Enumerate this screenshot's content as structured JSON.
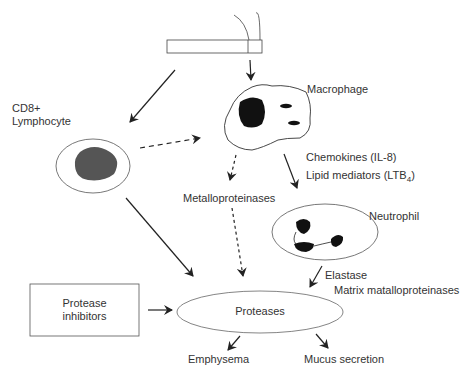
{
  "diagram": {
    "labels": {
      "macrophage": "Macrophage",
      "cd8_line1": "CD8+",
      "cd8_line2": "Lymphocyte",
      "chemokines": "Chemokines (IL-8)",
      "lipid_mediators": "Lipid mediators (LTB",
      "lipid_sub": "4",
      "lipid_close": ")",
      "metalloproteinases": "Metalloproteinases",
      "neutrophil": "Neutrophil",
      "elastase": "Elastase",
      "matrix_mmp": "Matrix matalloproteinases",
      "protease_inhibitors_line1": "Protease",
      "protease_inhibitors_line2": "inhibitors",
      "proteases": "Proteases",
      "emphysema": "Emphysema",
      "mucus_secretion": "Mucus secretion"
    },
    "nodes": [
      "Cigarette",
      "Macrophage",
      "CD8+ Lymphocyte",
      "Neutrophil",
      "Protease inhibitors",
      "Proteases",
      "Emphysema",
      "Mucus secretion"
    ],
    "edges": [
      {
        "from": "Cigarette",
        "to": "Macrophage",
        "style": "solid"
      },
      {
        "from": "Cigarette",
        "to": "CD8+ Lymphocyte",
        "style": "solid"
      },
      {
        "from": "CD8+ Lymphocyte",
        "to": "Macrophage",
        "style": "dashed"
      },
      {
        "from": "Macrophage",
        "to": "Metalloproteinases",
        "style": "dashed"
      },
      {
        "from": "Macrophage",
        "to": "Neutrophil",
        "style": "solid",
        "label": "Chemokines (IL-8), Lipid mediators (LTB4)"
      },
      {
        "from": "Metalloproteinases",
        "to": "Proteases",
        "style": "dashed"
      },
      {
        "from": "CD8+ Lymphocyte",
        "to": "Proteases",
        "style": "solid"
      },
      {
        "from": "Neutrophil",
        "to": "Proteases",
        "style": "solid",
        "label": "Elastase, Matrix matalloproteinases"
      },
      {
        "from": "Protease inhibitors",
        "to": "Proteases",
        "style": "solid"
      },
      {
        "from": "Proteases",
        "to": "Emphysema",
        "style": "solid"
      },
      {
        "from": "Proteases",
        "to": "Mucus secretion",
        "style": "solid"
      }
    ],
    "colors": {
      "line": "#333333",
      "nucleus_dark": "#111111",
      "nucleus_gray": "#555555"
    }
  }
}
